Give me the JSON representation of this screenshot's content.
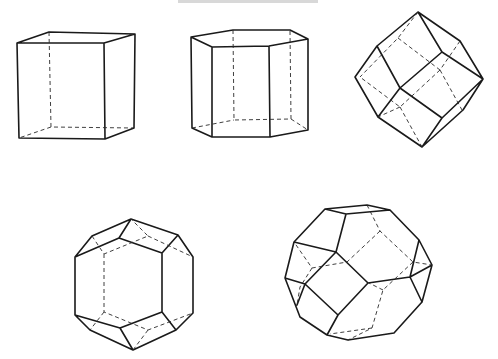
{
  "figure": {
    "header_text_visible": false,
    "ink_color": "#1a1a1a",
    "background": "#ffffff",
    "shapes": [
      {
        "id": "cube",
        "name": "Cube",
        "faces": 6
      },
      {
        "id": "hexagonal-prism",
        "name": "Hexagonal prism",
        "faces": 8
      },
      {
        "id": "rhombic-dodecahedron",
        "name": "Rhombic dodecahedron",
        "faces": 12
      },
      {
        "id": "elongated-dodecahedron",
        "name": "Elongated dodecahedron",
        "faces": 12
      },
      {
        "id": "truncated-octahedron",
        "name": "Truncated octahedron",
        "faces": 14
      }
    ]
  }
}
